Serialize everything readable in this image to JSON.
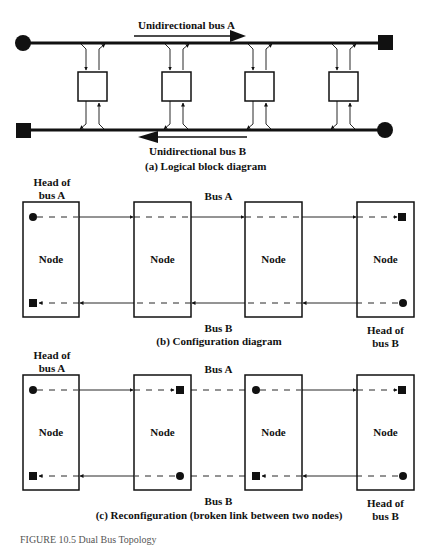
{
  "panel_a": {
    "bus_a_label": "Unidirectional bus A",
    "bus_b_label": "Unidirectional bus B",
    "caption": "(a) Logical block diagram"
  },
  "panel_b": {
    "head_a_line1": "Head of",
    "head_a_line2": "bus A",
    "bus_a_label": "Bus A",
    "bus_b_label": "Bus B",
    "head_b_line1": "Head of",
    "head_b_line2": "bus B",
    "caption": "(b) Configuration diagram",
    "nodes": [
      "Node",
      "Node",
      "Node",
      "Node"
    ]
  },
  "panel_c": {
    "head_a_line1": "Head of",
    "head_a_line2": "bus A",
    "bus_a_label": "Bus A",
    "bus_b_label": "Bus B",
    "head_b_line1": "Head of",
    "head_b_line2": "bus B",
    "caption": "(c) Reconfiguration (broken link between two nodes)",
    "nodes": [
      "Node",
      "Node",
      "Node",
      "Node"
    ]
  },
  "figure_caption": "FIGURE 10.5   Dual Bus Topology",
  "colors": {
    "ink": "#111111",
    "background": "#ffffff"
  }
}
